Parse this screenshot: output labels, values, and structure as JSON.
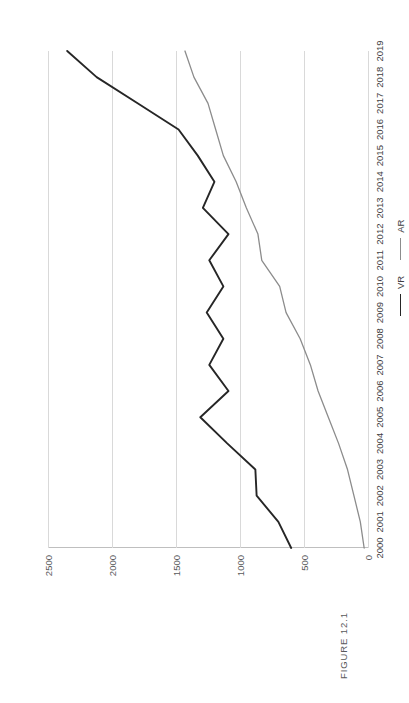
{
  "figure": {
    "label": "FIGURE 12.1"
  },
  "legend": {
    "items": [
      {
        "name": "VR",
        "label": "VR",
        "color": "#262626"
      },
      {
        "name": "AR",
        "label": "AR",
        "color": "#8c8c8c"
      }
    ]
  },
  "chart_data": {
    "type": "line",
    "title": "FIGURE 12.1",
    "xlabel": "",
    "ylabel": "",
    "grid": true,
    "legend_position": "bottom-right",
    "orientation": "rotated-90-ccw",
    "categories": [
      "2000",
      "2001",
      "2002",
      "2003",
      "2004",
      "2005",
      "2006",
      "2007",
      "2008",
      "2009",
      "2010",
      "2011",
      "2012",
      "2013",
      "2014",
      "2015",
      "2016",
      "2017",
      "2018",
      "2019"
    ],
    "yticks": [
      "0",
      "500",
      "1000",
      "1500",
      "2000",
      "2500"
    ],
    "ytick_values": [
      0,
      500,
      1000,
      1500,
      2000,
      2500
    ],
    "ylim": [
      0,
      2500
    ],
    "series": [
      {
        "name": "VR",
        "color": "#262626",
        "values": [
          600,
          700,
          870,
          880,
          1100,
          1310,
          1090,
          1240,
          1130,
          1260,
          1130,
          1240,
          1090,
          1290,
          1200,
          1330,
          1480,
          1800,
          2120,
          2350
        ]
      },
      {
        "name": "AR",
        "color": "#8c8c8c",
        "values": [
          30,
          60,
          110,
          160,
          230,
          310,
          390,
          450,
          530,
          640,
          690,
          830,
          860,
          950,
          1030,
          1130,
          1190,
          1250,
          1360,
          1430
        ]
      }
    ]
  }
}
